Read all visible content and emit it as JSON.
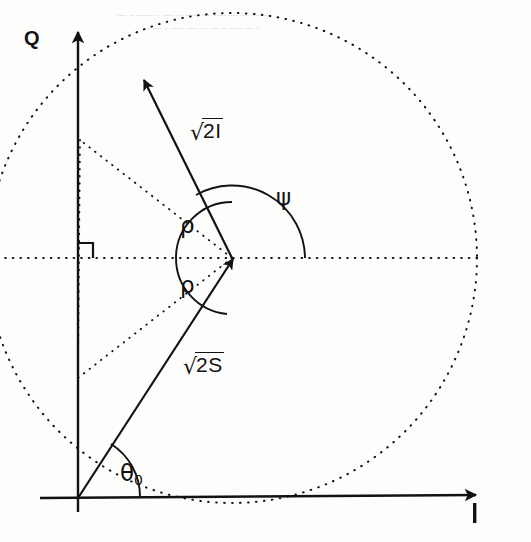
{
  "figure": {
    "type": "vector-phasor-diagram",
    "background_color": "#fdfdfc",
    "stroke_color": "#121212"
  },
  "axes": {
    "horizontal": {
      "label": "I",
      "name": "in-phase-axis",
      "origin": [
        78,
        498
      ],
      "tip": [
        478,
        494
      ]
    },
    "vertical": {
      "label": "Q",
      "name": "quadrature-axis",
      "origin": [
        78,
        498
      ],
      "tip": [
        78,
        30
      ]
    }
  },
  "vectors": [
    {
      "name": "signal-vector",
      "label_parts": {
        "radical": "√",
        "radicand": "2S"
      },
      "label_text": "√2S",
      "from": [
        78,
        498
      ],
      "to": [
        232,
        258
      ],
      "label_pos": [
        185,
        356
      ]
    },
    {
      "name": "interference-vector",
      "label_parts": {
        "radical": "√",
        "radicand": "2I"
      },
      "label_text": "√2I",
      "from": [
        232,
        258
      ],
      "to": [
        143,
        78
      ],
      "label_pos": [
        196,
        122
      ]
    }
  ],
  "angles": [
    {
      "name": "theta-zero",
      "label": "θ",
      "subscript": "0",
      "label_pos": [
        122,
        466
      ],
      "vertex": [
        78,
        498
      ],
      "radius": 62
    },
    {
      "name": "psi",
      "label": "ψ",
      "label_pos": [
        277,
        189
      ],
      "vertex": [
        232,
        258
      ],
      "radius": 73
    },
    {
      "name": "rho-upper",
      "label": "ρ",
      "label_pos": [
        181,
        214
      ],
      "vertex": [
        232,
        258
      ],
      "radius": 56
    },
    {
      "name": "rho-lower",
      "label": "ρ",
      "label_pos": [
        181,
        276
      ],
      "vertex": [
        232,
        258
      ],
      "radius": 56
    }
  ],
  "circle": {
    "name": "uncertainty-circle",
    "center": [
      232,
      258
    ],
    "radius": 245,
    "style": "dotted"
  },
  "construction_lines": [
    {
      "name": "horizontal-reference-dotted",
      "from": [
        -10,
        258
      ],
      "to": [
        477,
        258
      ]
    },
    {
      "name": "rho-upper-ray-dotted",
      "from": [
        232,
        258
      ],
      "to": [
        80,
        140
      ]
    },
    {
      "name": "rho-lower-ray-dotted",
      "from": [
        232,
        258
      ],
      "to": [
        78,
        378
      ]
    },
    {
      "name": "chord-dotted",
      "from": [
        80,
        140
      ],
      "to": [
        78,
        378
      ]
    }
  ],
  "markers": [
    {
      "name": "right-angle-marker",
      "pos": [
        78,
        258
      ],
      "size": 15
    }
  ],
  "bleed_through_text": [
    "—  –  ——  –  —  –– —– —  –—  — –– —  —",
    "–  — – —–  — ––  —  –  —– — –"
  ]
}
